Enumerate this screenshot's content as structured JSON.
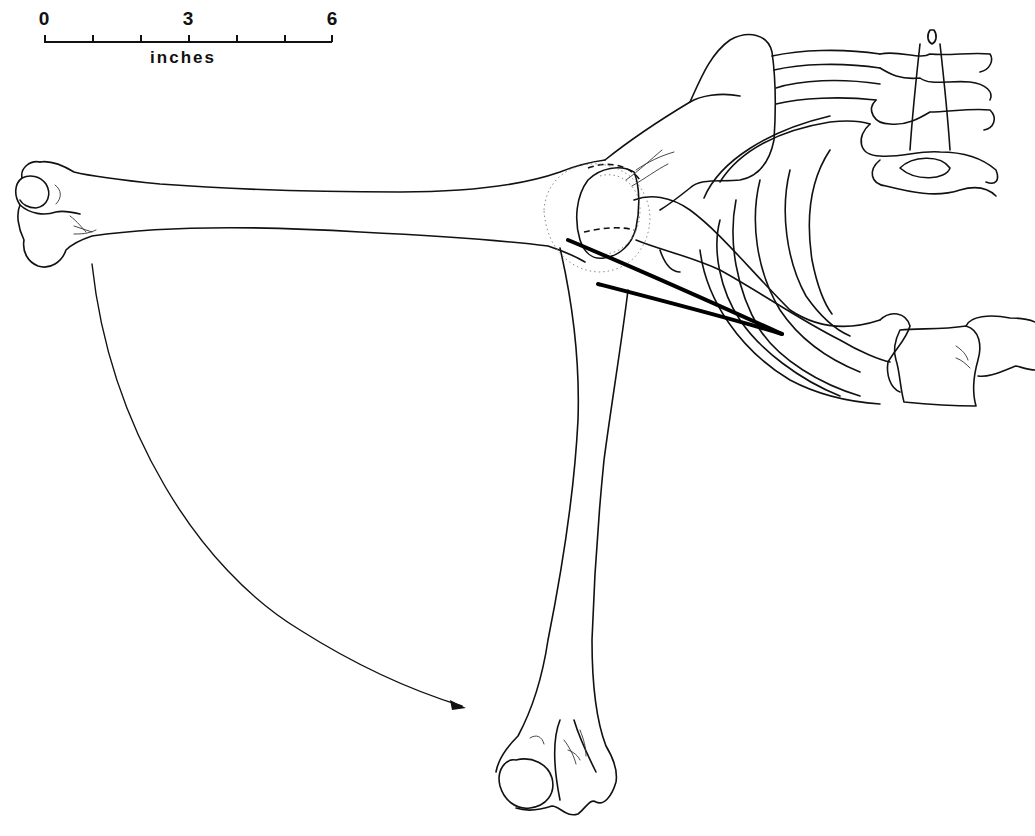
{
  "figure": {
    "type": "anatomical line drawing",
    "scale_bar": {
      "labels": [
        "0",
        "3",
        "6"
      ],
      "unit": "inches",
      "ticks": 7
    },
    "elements": [
      {
        "name": "humerus-horizontal-position"
      },
      {
        "name": "humerus-vertical-position"
      },
      {
        "name": "rotation-arrow",
        "direction": "clockwise-down"
      },
      {
        "name": "scapula"
      },
      {
        "name": "ribcage"
      },
      {
        "name": "vertebral-column"
      },
      {
        "name": "sternum-segments"
      },
      {
        "name": "muscle-lines",
        "count": 2
      }
    ],
    "colors": {
      "ink": "#111111",
      "background": "#ffffff"
    }
  }
}
